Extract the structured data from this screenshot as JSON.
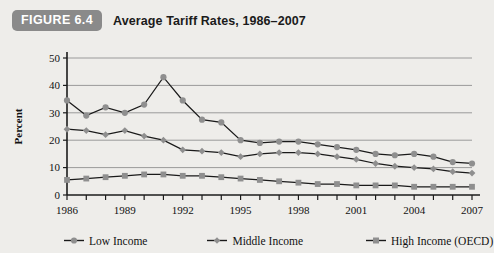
{
  "figure": {
    "badge": "FIGURE 6.4",
    "title": "Average Tariff Rates, 1986–2007"
  },
  "colors": {
    "badge_bg": "#8a8a8a",
    "badge_text": "#ffffff",
    "page_bg": "#eeedea",
    "line": "#1a1a1a",
    "grid": "#9a9a9a",
    "axis": "#1b1b1b",
    "low_income_marker": "#8f8f8f",
    "middle_income_marker": "#8f8f8f",
    "high_income_marker": "#8f8f8f"
  },
  "chart_data": {
    "type": "line",
    "title": "Average Tariff Rates, 1986–2007",
    "xlabel": "",
    "ylabel": "Percent",
    "ylim": [
      0,
      50
    ],
    "ytick_step": 10,
    "yticks": [
      0,
      10,
      20,
      30,
      40,
      50
    ],
    "grid": true,
    "legend_position": "bottom",
    "x": [
      1986,
      1987,
      1988,
      1989,
      1990,
      1991,
      1992,
      1993,
      1994,
      1995,
      1996,
      1997,
      1998,
      1999,
      2000,
      2001,
      2002,
      2003,
      2004,
      2005,
      2006,
      2007
    ],
    "xtick_labels": [
      "1986",
      "1989",
      "1992",
      "1995",
      "1998",
      "2001",
      "2004",
      "2007"
    ],
    "xtick_values": [
      1986,
      1989,
      1992,
      1995,
      1998,
      2001,
      2004,
      2007
    ],
    "series": [
      {
        "name": "Low Income",
        "marker": "circle",
        "values": [
          34.5,
          29.0,
          32.0,
          30.0,
          33.0,
          43.0,
          34.5,
          27.5,
          26.5,
          20.0,
          19.0,
          19.5,
          19.5,
          18.5,
          17.5,
          16.5,
          15.0,
          14.5,
          15.0,
          14.0,
          12.0,
          11.5
        ]
      },
      {
        "name": "Middle Income",
        "marker": "diamond",
        "values": [
          24.0,
          23.5,
          22.0,
          23.5,
          21.5,
          20.0,
          16.5,
          16.0,
          15.5,
          14.0,
          15.0,
          15.5,
          15.5,
          15.0,
          14.0,
          13.0,
          11.5,
          10.5,
          10.0,
          9.5,
          8.5,
          8.0
        ]
      },
      {
        "name": "High Income (OECD)",
        "marker": "square",
        "values": [
          5.5,
          6.0,
          6.5,
          7.0,
          7.5,
          7.5,
          7.0,
          7.0,
          6.5,
          6.0,
          5.5,
          5.0,
          4.5,
          4.0,
          4.0,
          3.5,
          3.5,
          3.5,
          3.0,
          3.0,
          3.0,
          3.0
        ]
      }
    ]
  }
}
